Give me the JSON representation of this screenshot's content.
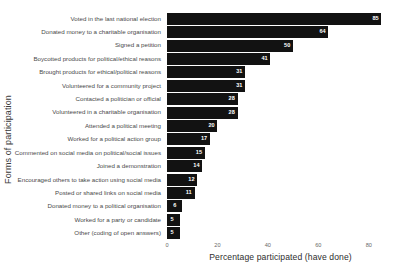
{
  "chart_data": {
    "type": "bar",
    "orientation": "horizontal",
    "title": "",
    "xlabel": "Percentage participated (have done)",
    "ylabel": "Forms of participation",
    "xlim": [
      0,
      90
    ],
    "xticks": [
      0,
      20,
      40,
      60,
      80
    ],
    "grid": false,
    "legend": null,
    "bar_color": "#121212",
    "value_label_color": "#ffffff",
    "background": "#ffffff",
    "categories": [
      "Voted in the last national election",
      "Donated money to a charitable organisation",
      "Signed a petition",
      "Boycotted products for political/ethical reasons",
      "Brought products for ethical/political reasons",
      "Volunteered for a community project",
      "Contacted a politician or official",
      "Volunteered in a charitable organisation",
      "Attended a political meeting",
      "Worked for a political action group",
      "Commented on social media on political/social issues",
      "Joined a demonstration",
      "Encouraged others to take action using social media",
      "Posted or shared links on social media",
      "Donated money to a political organisation",
      "Worked for a party or candidate",
      "Other (coding of open answers)"
    ],
    "values": [
      85,
      64,
      50,
      41,
      31,
      31,
      28,
      28,
      20,
      17,
      15,
      14,
      12,
      11,
      6,
      5,
      5
    ]
  }
}
